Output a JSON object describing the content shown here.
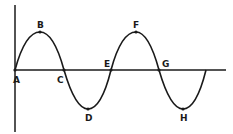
{
  "diagram": {
    "type": "transverse-wave",
    "colors": {
      "line": "#1a1a1a",
      "background": "#ffffff"
    },
    "axes": {
      "vertical_x": 15,
      "horizontal_y": 70
    },
    "points": [
      {
        "label": "A",
        "x": 15,
        "y": 70,
        "role": "origin"
      },
      {
        "label": "B",
        "x": 40,
        "y": 32,
        "role": "crest"
      },
      {
        "label": "C",
        "x": 64,
        "y": 70,
        "role": "node"
      },
      {
        "label": "D",
        "x": 88,
        "y": 109,
        "role": "trough"
      },
      {
        "label": "E",
        "x": 111,
        "y": 70,
        "role": "node"
      },
      {
        "label": "F",
        "x": 136,
        "y": 32,
        "role": "crest"
      },
      {
        "label": "G",
        "x": 159,
        "y": 70,
        "role": "node"
      },
      {
        "label": "H",
        "x": 183,
        "y": 109,
        "role": "trough"
      }
    ]
  }
}
